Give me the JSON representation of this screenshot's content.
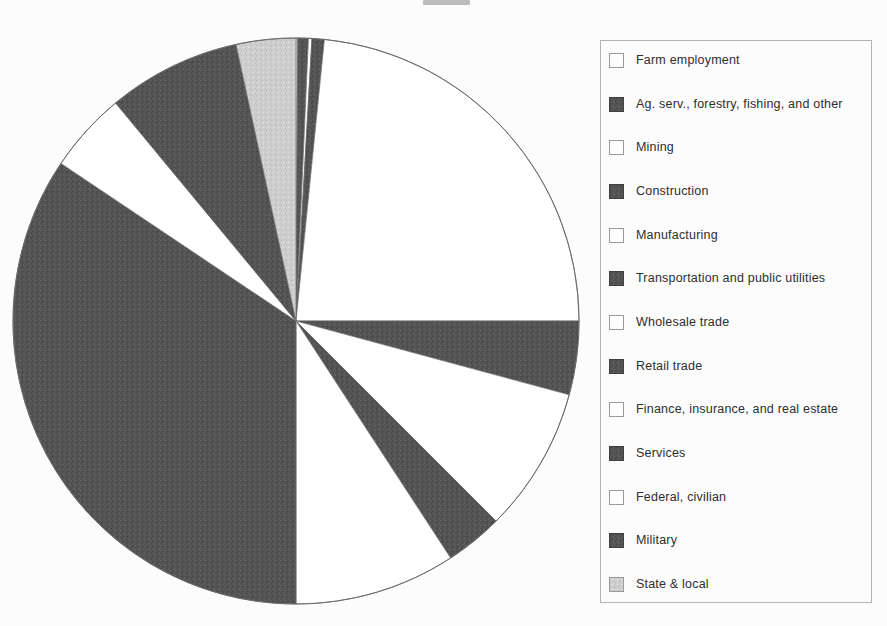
{
  "chart_data": {
    "type": "pie",
    "title": "",
    "unit": "percent",
    "start_angle_deg": 0,
    "direction": "clockwise",
    "legend_position": "right",
    "slices": [
      {
        "label": "Farm employment",
        "value": 0.1,
        "style": "white"
      },
      {
        "label": "Ag. serv., forestry, fishing, and other",
        "value": 0.6,
        "style": "dark"
      },
      {
        "label": "Mining",
        "value": 0.2,
        "style": "white"
      },
      {
        "label": "Construction",
        "value": 0.7,
        "style": "dark"
      },
      {
        "label": "Manufacturing",
        "value": 23.4,
        "style": "white"
      },
      {
        "label": "Transportation and public utilities",
        "value": 4.2,
        "style": "dark"
      },
      {
        "label": "Wholesale trade",
        "value": 8.3,
        "style": "white"
      },
      {
        "label": "Retail trade",
        "value": 3.3,
        "style": "dark"
      },
      {
        "label": "Finance, insurance, and real estate",
        "value": 9.2,
        "style": "white"
      },
      {
        "label": "Services",
        "value": 34.4,
        "style": "dark"
      },
      {
        "label": "Federal, civilian",
        "value": 4.6,
        "style": "white"
      },
      {
        "label": "Military",
        "value": 7.6,
        "style": "dark"
      },
      {
        "label": "State & local",
        "value": 3.4,
        "style": "light"
      }
    ]
  },
  "colors": {
    "dark_fill": "#535353",
    "light_fill": "#cfcfcf",
    "white_fill": "#ffffff",
    "outline": "#6a6a6a",
    "dark_swatch_border": "#3f3f3f",
    "light_swatch_border": "#999999",
    "legend_border": "#b3b3b3",
    "text": "#2e2e2e"
  }
}
